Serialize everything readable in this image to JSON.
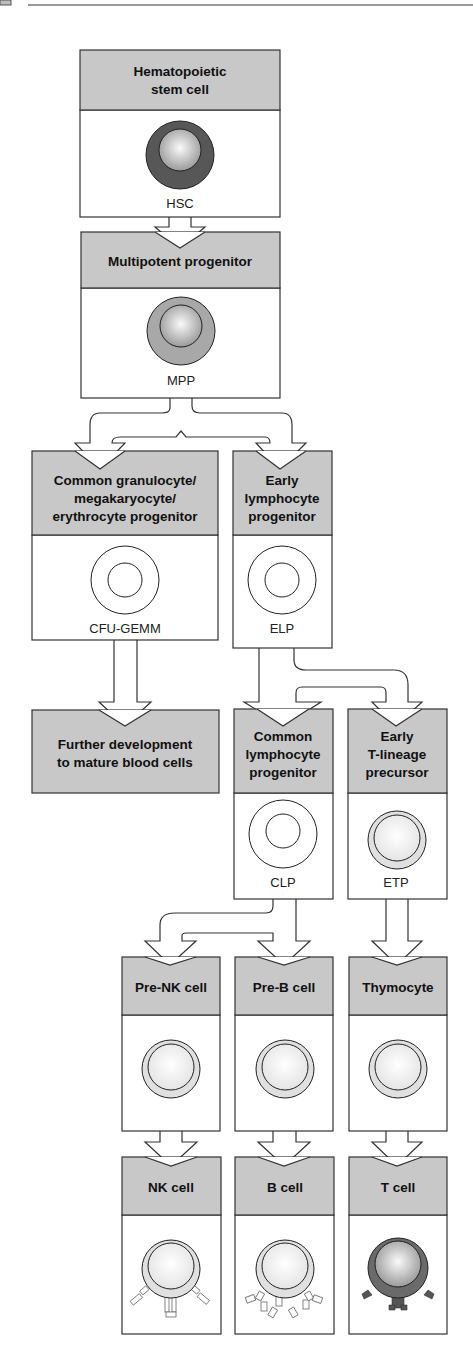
{
  "colors": {
    "header_fill": "#c8c8c8",
    "body_fill": "#ffffff",
    "stroke": "#333333",
    "cell_dark": "#5a5a5a",
    "cell_mid": "#a8a8a8",
    "cell_light": "#e0e0e0"
  },
  "nodes": {
    "hsc": {
      "title_lines": [
        "Hematopoietic",
        "stem cell"
      ],
      "label": "HSC"
    },
    "mpp": {
      "title_lines": [
        "Multipotent progenitor"
      ],
      "label": "MPP"
    },
    "cfu_gemm": {
      "title_lines": [
        "Common granulocyte/",
        "megakaryocyte/",
        "erythrocyte progenitor"
      ],
      "label": "CFU-GEMM"
    },
    "elp": {
      "title_lines": [
        "Early",
        "lymphocyte",
        "progenitor"
      ],
      "label": "ELP"
    },
    "further": {
      "title_lines": [
        "Further development",
        "to mature blood cells"
      ]
    },
    "clp": {
      "title_lines": [
        "Common",
        "lymphocyte",
        "progenitor"
      ],
      "label": "CLP"
    },
    "etp": {
      "title_lines": [
        "Early",
        "T-lineage",
        "precursor"
      ],
      "label": "ETP"
    },
    "pre_nk": {
      "title_lines": [
        "Pre-NK cell"
      ]
    },
    "pre_b": {
      "title_lines": [
        "Pre-B cell"
      ]
    },
    "thymocyte": {
      "title_lines": [
        "Thymocyte"
      ]
    },
    "nk": {
      "title_lines": [
        "NK cell"
      ]
    },
    "b": {
      "title_lines": [
        "B cell"
      ]
    },
    "t": {
      "title_lines": [
        "T cell"
      ]
    }
  }
}
